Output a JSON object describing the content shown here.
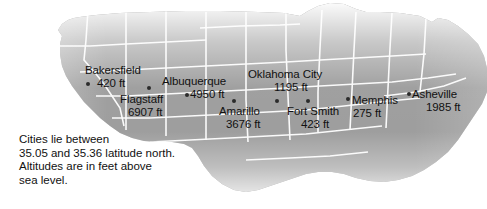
{
  "figure": {
    "background_color": "#ffffff",
    "land_color": "#9a9a9a",
    "border_color": "#ffffff",
    "marker_color": "#2b2b2b",
    "text_color": "#111111"
  },
  "caption": {
    "line1": "Cities lie between",
    "line2": "35.05 and 35.36 latitude north.",
    "line3": "Altitudes are in feet above",
    "line4": "sea level."
  },
  "cities": [
    {
      "name": "Bakersfield",
      "altitude": "420 ft",
      "altitude_value": 420,
      "unit": "ft",
      "x": 88,
      "y": 84
    },
    {
      "name": "Flagstaff",
      "altitude": "6907 ft",
      "altitude_value": 6907,
      "unit": "ft",
      "x": 149,
      "y": 88
    },
    {
      "name": "Albuquerque",
      "altitude": "4950 ft",
      "altitude_value": 4950,
      "unit": "ft",
      "x": 187,
      "y": 95
    },
    {
      "name": "Amarillo",
      "altitude": "3676 ft",
      "altitude_value": 3676,
      "unit": "ft",
      "x": 234,
      "y": 101
    },
    {
      "name": "Oklahoma City",
      "altitude": "1195 ft",
      "altitude_value": 1195,
      "unit": "ft",
      "x": 277,
      "y": 101
    },
    {
      "name": "Fort Smith",
      "altitude": "423 ft",
      "altitude_value": 423,
      "unit": "ft",
      "x": 308,
      "y": 101
    },
    {
      "name": "Memphis",
      "altitude": "275 ft",
      "altitude_value": 275,
      "unit": "ft",
      "x": 348,
      "y": 99
    },
    {
      "name": "Asheville",
      "altitude": "1985 ft",
      "altitude_value": 1985,
      "unit": "ft",
      "x": 409,
      "y": 94
    }
  ]
}
